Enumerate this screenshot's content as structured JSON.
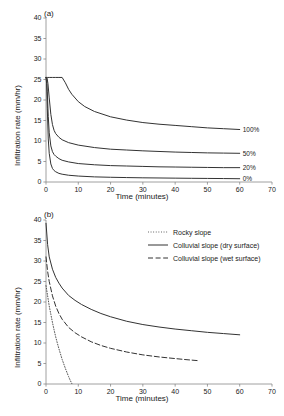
{
  "figure": {
    "panel_a_label": "(a)",
    "panel_b_label": "(b)"
  },
  "chart_data": [
    {
      "type": "line",
      "panel": "(a)",
      "title": "",
      "xlabel": "Time (minutes)",
      "ylabel": "Infiltration rate (mm/hr)",
      "xlim": [
        0,
        70
      ],
      "ylim": [
        0,
        40
      ],
      "xticks": [
        0,
        10,
        20,
        30,
        40,
        50,
        60,
        70
      ],
      "yticks": [
        0,
        5,
        10,
        15,
        20,
        25,
        30,
        35,
        40
      ],
      "grid": false,
      "legend_position": "curve-end-labels",
      "series": [
        {
          "name": "100%",
          "label": "100%",
          "style": "solid",
          "color": "#333333",
          "x": [
            0,
            0.5,
            1,
            2,
            3,
            4,
            5,
            6,
            7,
            8,
            10,
            12,
            15,
            20,
            25,
            30,
            35,
            40,
            45,
            50,
            55,
            60
          ],
          "y": [
            25.5,
            25.5,
            25.5,
            25.5,
            25.5,
            25.5,
            25.5,
            24.2,
            22.6,
            21.4,
            19.6,
            18.4,
            17.2,
            15.9,
            15.1,
            14.5,
            14.1,
            13.8,
            13.5,
            13.2,
            13.0,
            12.8
          ]
        },
        {
          "name": "50%",
          "label": "50%",
          "style": "solid",
          "color": "#333333",
          "x": [
            0,
            0.3,
            0.6,
            1,
            1.5,
            2,
            2.5,
            3,
            4,
            5,
            7,
            10,
            15,
            20,
            25,
            30,
            35,
            40,
            45,
            50,
            55,
            60
          ],
          "y": [
            25.5,
            25.5,
            24.0,
            20.5,
            16.5,
            14.0,
            12.6,
            11.8,
            10.9,
            10.3,
            9.6,
            9.0,
            8.4,
            8.0,
            7.8,
            7.6,
            7.45,
            7.3,
            7.2,
            7.1,
            7.05,
            7.0
          ]
        },
        {
          "name": "20%",
          "label": "20%",
          "style": "solid",
          "color": "#333333",
          "x": [
            0,
            0.2,
            0.4,
            0.7,
            1,
            1.5,
            2,
            2.5,
            3,
            4,
            5,
            7,
            10,
            15,
            20,
            25,
            30,
            35,
            40,
            45,
            50,
            55,
            60
          ],
          "y": [
            25.5,
            25.0,
            22.0,
            16.0,
            12.0,
            8.8,
            7.4,
            6.7,
            6.3,
            5.7,
            5.3,
            4.9,
            4.5,
            4.2,
            4.0,
            3.9,
            3.8,
            3.7,
            3.65,
            3.6,
            3.55,
            3.5,
            3.5
          ]
        },
        {
          "name": "0%",
          "label": "0%",
          "style": "solid",
          "color": "#333333",
          "x": [
            0,
            0.2,
            0.4,
            0.7,
            1,
            1.5,
            2,
            2.5,
            3,
            4,
            5,
            7,
            10,
            15,
            20,
            25,
            30,
            35,
            40,
            45,
            50,
            55,
            60
          ],
          "y": [
            25.5,
            24.0,
            18.0,
            10.5,
            7.0,
            4.4,
            3.3,
            2.8,
            2.5,
            2.1,
            1.9,
            1.65,
            1.45,
            1.25,
            1.15,
            1.08,
            1.02,
            0.98,
            0.94,
            0.9,
            0.87,
            0.84,
            0.8
          ]
        }
      ]
    },
    {
      "type": "line",
      "panel": "(b)",
      "title": "",
      "xlabel": "Time (minutes)",
      "ylabel": "Infiltration rate (mm/hr)",
      "xlim": [
        0,
        70
      ],
      "ylim": [
        0,
        40
      ],
      "xticks": [
        0,
        10,
        20,
        30,
        40,
        50,
        60,
        70
      ],
      "yticks": [
        0,
        5,
        10,
        15,
        20,
        25,
        30,
        35,
        40
      ],
      "grid": false,
      "legend_position": "upper-right",
      "series": [
        {
          "name": "Rocky slope",
          "label": "Rocky slope",
          "style": "dotted",
          "color": "#555555",
          "x": [
            0,
            0.5,
            1,
            1.5,
            2,
            2.5,
            3,
            3.5,
            4,
            4.5,
            5,
            5.5,
            6,
            6.5,
            7,
            7.5,
            8
          ],
          "y": [
            24.0,
            21.5,
            19.0,
            17.0,
            15.0,
            13.2,
            11.5,
            10.0,
            8.6,
            7.3,
            6.0,
            4.9,
            3.8,
            2.8,
            1.8,
            0.9,
            0.1
          ]
        },
        {
          "name": "Colluvial slope (dry surface)",
          "label": "Colluvial slope (dry surface)",
          "style": "solid",
          "color": "#333333",
          "x": [
            0,
            0.5,
            1,
            2,
            3,
            4,
            5,
            7,
            9,
            11,
            14,
            17,
            20,
            25,
            30,
            35,
            40,
            45,
            50,
            55,
            60
          ],
          "y": [
            39.2,
            34.0,
            31.0,
            28.0,
            26.0,
            24.6,
            23.4,
            21.6,
            20.4,
            19.4,
            18.2,
            17.2,
            16.4,
            15.3,
            14.5,
            13.9,
            13.4,
            13.0,
            12.6,
            12.3,
            12.0
          ]
        },
        {
          "name": "Colluvial slope (wet surface)",
          "label": "Colluvial slope (wet surface)",
          "style": "dashed",
          "color": "#333333",
          "x": [
            0,
            0.5,
            1,
            2,
            3,
            4,
            5,
            7,
            9,
            11,
            14,
            17,
            20,
            25,
            30,
            35,
            40,
            44,
            47
          ],
          "y": [
            31.0,
            27.5,
            25.0,
            21.5,
            19.0,
            17.2,
            15.8,
            13.8,
            12.5,
            11.5,
            10.3,
            9.4,
            8.7,
            7.8,
            7.1,
            6.6,
            6.2,
            5.9,
            5.7
          ]
        }
      ]
    }
  ]
}
